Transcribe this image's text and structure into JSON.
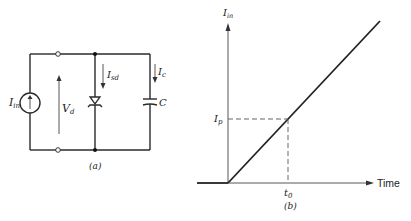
{
  "circuit": {
    "caption": "(a)",
    "source_label": "I",
    "source_sub": "in",
    "voltage_label": "V",
    "voltage_sub": "d",
    "diode_current_label": "I",
    "diode_current_sub": "sd",
    "cap_current_label": "I",
    "cap_current_sub": "c",
    "cap_label": "C"
  },
  "graph": {
    "caption": "(b)",
    "y_label": "I",
    "y_sub": "in",
    "x_label": "Time",
    "ip_label": "I",
    "ip_sub": "p",
    "t0_label": "t",
    "t0_sub": "0"
  }
}
